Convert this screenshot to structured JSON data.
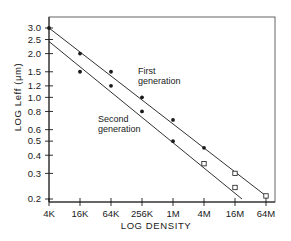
{
  "chart_data": {
    "type": "line",
    "title": "",
    "xlabel": "LOG DENSITY",
    "ylabel": "LOG Leff (μm)",
    "x_scale": "log4",
    "y_scale": "log",
    "categories": [
      "4K",
      "16K",
      "64K",
      "256K",
      "1M",
      "4M",
      "16M",
      "64M"
    ],
    "yticks": [
      "3.0",
      "2.5",
      "2.0",
      "1.5",
      "1.2",
      "1.0",
      "0.8",
      "0.6",
      "0.5",
      "0.4",
      "0.3",
      "0.2"
    ],
    "ytick_values": [
      3.0,
      2.5,
      2.0,
      1.5,
      1.2,
      1.0,
      0.8,
      0.6,
      0.5,
      0.4,
      0.3,
      0.2
    ],
    "ylim": [
      0.2,
      3.0
    ],
    "grid": false,
    "legend": "none (inline annotations)",
    "series": [
      {
        "name": "First generation",
        "points": [
          {
            "x": "4K",
            "y": 3.0,
            "marker": "filled"
          },
          {
            "x": "16K",
            "y": 2.0,
            "marker": "filled"
          },
          {
            "x": "64K",
            "y": 1.5,
            "marker": "filled"
          },
          {
            "x": "256K",
            "y": 1.0,
            "marker": "filled"
          },
          {
            "x": "1M",
            "y": 0.7,
            "marker": "filled"
          },
          {
            "x": "4M",
            "y": 0.45,
            "marker": "filled"
          },
          {
            "x": "16M",
            "y": 0.3,
            "marker": "open-square"
          },
          {
            "x": "64M",
            "y": 0.21,
            "marker": "open-square"
          }
        ],
        "fit_line": {
          "from": {
            "x": "4K",
            "y": 3.0
          },
          "to": {
            "x": "64M",
            "y": 0.21
          }
        }
      },
      {
        "name": "Second generation",
        "points": [
          {
            "x": "16K",
            "y": 1.5,
            "marker": "filled"
          },
          {
            "x": "64K",
            "y": 1.2,
            "marker": "filled"
          },
          {
            "x": "256K",
            "y": 0.8,
            "marker": "filled"
          },
          {
            "x": "1M",
            "y": 0.5,
            "marker": "filled"
          },
          {
            "x": "4M",
            "y": 0.35,
            "marker": "open-square"
          },
          {
            "x": "16M",
            "y": 0.24,
            "marker": "open-square"
          }
        ],
        "fit_line": {
          "from": {
            "x": "4K",
            "y": 2.5
          },
          "to": {
            "x": "16M+",
            "y": 0.2
          }
        }
      }
    ],
    "annotations": [
      {
        "text_line1": "First",
        "text_line2": "generation"
      },
      {
        "text_line1": "Second",
        "text_line2": "generation"
      }
    ]
  },
  "colors": {
    "ink": "#1a1a1a",
    "background": "#ffffff",
    "frame": "#555555"
  }
}
